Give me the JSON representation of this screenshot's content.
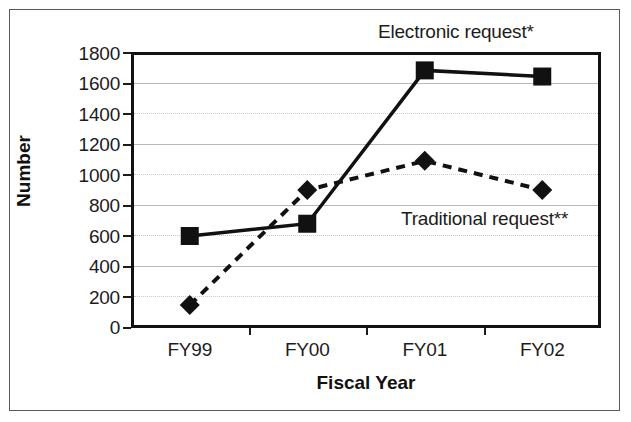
{
  "chart_data": {
    "type": "line",
    "title": "",
    "xlabel": "Fiscal Year",
    "ylabel": "Number",
    "categories": [
      "FY99",
      "FY00",
      "FY01",
      "FY02"
    ],
    "ylim": [
      0,
      1800
    ],
    "yticks": [
      0,
      200,
      400,
      600,
      800,
      1000,
      1200,
      1400,
      1600,
      1800
    ],
    "ytick_labels": [
      "0",
      "200",
      "400",
      "600",
      "800",
      "1000",
      "1200",
      "1400",
      "1600",
      "1800"
    ],
    "grid": true,
    "legend_position": "inline-annotations",
    "series": [
      {
        "name": "Electronic request*",
        "marker": "square",
        "line_style": "solid",
        "color": "#111111",
        "values": [
          600,
          680,
          1680,
          1640
        ]
      },
      {
        "name": "Traditional request**",
        "marker": "diamond",
        "line_style": "dashed",
        "color": "#111111",
        "values": [
          150,
          900,
          1090,
          900
        ]
      }
    ],
    "annotations": [
      {
        "id": "electronic",
        "text": "Electronic request*"
      },
      {
        "id": "traditional",
        "text": "Traditional request**"
      }
    ]
  },
  "axes": {
    "y_title": "Number",
    "x_title": "Fiscal Year"
  }
}
